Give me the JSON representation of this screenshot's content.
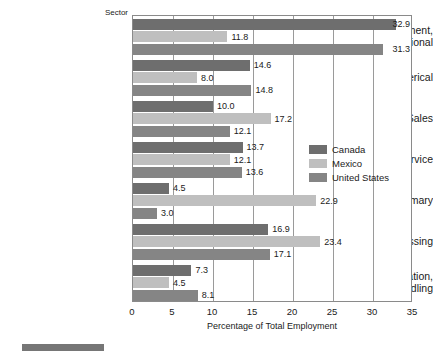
{
  "chart_data": {
    "type": "bar",
    "orientation": "horizontal",
    "title": "",
    "xlabel": "Percentage of Total Employment",
    "ylabel": "Sector",
    "xlim": [
      0,
      35
    ],
    "xticks": [
      "0",
      "5",
      "10",
      "15",
      "20",
      "25",
      "30",
      "35"
    ],
    "grid": true,
    "legend_position": "middle-right-inside",
    "categories": [
      "Management,\nTechnical, Professional",
      "Clerical",
      "Sales",
      "Service",
      "Primary",
      "Processing",
      "Transportation,\nMaterials Handling"
    ],
    "series": [
      {
        "name": "Canada",
        "color": "#6e6e6e",
        "values": [
          32.9,
          14.6,
          10.0,
          13.7,
          4.5,
          16.9,
          7.3
        ],
        "labels": [
          "32.9",
          "14.6",
          "10.0",
          "13.7",
          "4.5",
          "16.9",
          "7.3"
        ]
      },
      {
        "name": "Mexico",
        "color": "#bfbfbf",
        "values": [
          11.8,
          8.0,
          17.2,
          12.1,
          22.9,
          23.4,
          4.5
        ],
        "labels": [
          "11.8",
          "8.0",
          "17.2",
          "12.1",
          "22.9",
          "23.4",
          "4.5"
        ]
      },
      {
        "name": "United States",
        "color": "#858585",
        "values": [
          31.3,
          14.8,
          12.1,
          13.6,
          3.0,
          17.1,
          8.1
        ],
        "labels": [
          "31.3",
          "14.8",
          "12.1",
          "13.6",
          "3.0",
          "17.1",
          "8.1"
        ]
      }
    ]
  },
  "axis": {
    "y_axis_title": "Sector",
    "x_axis_title": "Percentage of Total Employment"
  },
  "legend": {
    "items": [
      {
        "label": "Canada",
        "color": "#6e6e6e"
      },
      {
        "label": "Mexico",
        "color": "#bfbfbf"
      },
      {
        "label": "United States",
        "color": "#858585"
      }
    ]
  }
}
